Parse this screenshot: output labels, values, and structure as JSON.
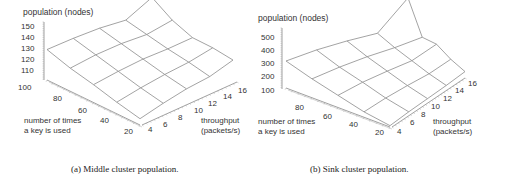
{
  "chart_data": [
    {
      "type": "surface3d",
      "title": "",
      "caption": "(a) Middle cluster population.",
      "zlabel": "population (nodes)",
      "xlabel": "throughput (packets/s)",
      "ylabel": "number of times a key is used",
      "z_ticks": [
        "150",
        "140",
        "130",
        "120",
        "110",
        "100"
      ],
      "x_ticks": [
        "4",
        "6",
        "8",
        "10",
        "12",
        "14",
        "16"
      ],
      "y_ticks": [
        "80",
        "60",
        "40",
        "20"
      ],
      "zlim": [
        100,
        155
      ],
      "x": [
        4,
        7,
        10,
        13,
        16
      ],
      "y": [
        100,
        80,
        60,
        40,
        20
      ],
      "z": [
        [
          106,
          110,
          113,
          114,
          119
        ],
        [
          111,
          115,
          118,
          120,
          124
        ],
        [
          117,
          121,
          124,
          125,
          127
        ],
        [
          122,
          127,
          130,
          131,
          137
        ],
        [
          129,
          133,
          136,
          137,
          152
        ]
      ],
      "grid": false
    },
    {
      "type": "surface3d",
      "title": "",
      "caption": "(b) Sink cluster population.",
      "zlabel": "population (nodes)",
      "xlabel": "throughput (packets/s)",
      "ylabel": "number of times a key is used",
      "z_ticks": [
        "500",
        "400",
        "300",
        "200",
        "100"
      ],
      "x_ticks": [
        "4",
        "6",
        "8",
        "10",
        "12",
        "14",
        "16"
      ],
      "y_ticks": [
        "80",
        "60",
        "40",
        "20"
      ],
      "zlim": [
        100,
        550
      ],
      "x": [
        4,
        7,
        10,
        13,
        16
      ],
      "y": [
        100,
        80,
        60,
        40,
        20
      ],
      "z": [
        [
          110,
          120,
          125,
          130,
          140
        ],
        [
          140,
          160,
          170,
          175,
          200
        ],
        [
          190,
          215,
          225,
          230,
          280
        ],
        [
          240,
          265,
          280,
          285,
          300
        ],
        [
          300,
          330,
          345,
          350,
          560
        ]
      ],
      "grid": false
    }
  ],
  "panels": [
    {
      "zlabel": "population (nodes)",
      "z_ticks": [
        "150",
        "140",
        "130",
        "120",
        "110",
        "100"
      ],
      "y_ticks": [
        "80",
        "60",
        "40",
        "20"
      ],
      "x_ticks": [
        "4",
        "6",
        "8",
        "10",
        "12",
        "14",
        "16"
      ],
      "ylabel_line1": "number of times",
      "ylabel_line2": "a key is used",
      "xlabel_line1": "throughput",
      "xlabel_line2": "(packets/s)",
      "caption": "(a) Middle cluster population."
    },
    {
      "zlabel": "population (nodes)",
      "z_ticks": [
        "500",
        "400",
        "300",
        "200",
        "100"
      ],
      "y_ticks": [
        "80",
        "60",
        "40",
        "20"
      ],
      "x_ticks": [
        "4",
        "6",
        "8",
        "10",
        "12",
        "14",
        "16"
      ],
      "ylabel_line1": "number of times",
      "ylabel_line2": "a key is used",
      "xlabel_line1": "throughput",
      "xlabel_line2": "(packets/s)",
      "caption": "(b) Sink cluster population."
    }
  ]
}
